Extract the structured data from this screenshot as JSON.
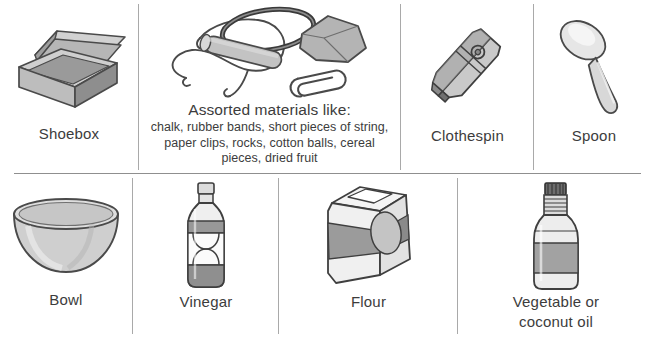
{
  "sheet": {
    "title": "Materials list illustration grid",
    "background": "#ffffff",
    "rule_color": "#a9a9a9",
    "text_color": "#3c3c3c"
  },
  "rows": [
    {
      "name": "top-row",
      "cells": [
        {
          "id": "shoebox",
          "label": "Shoebox",
          "icon": "shoebox-illustration"
        },
        {
          "id": "assorted",
          "label": "",
          "icon": "assorted-materials-illustration",
          "heading": "Assorted materials like:",
          "list": "chalk, rubber bands, short pieces of string, paper clips, rocks, cotton balls, cereal pieces, dried fruit"
        },
        {
          "id": "clothespin",
          "label": "Clothespin",
          "icon": "clothespin-illustration"
        },
        {
          "id": "spoon",
          "label": "Spoon",
          "icon": "spoon-illustration"
        }
      ]
    },
    {
      "name": "bottom-row",
      "cells": [
        {
          "id": "bowl",
          "label": "Bowl",
          "icon": "bowl-illustration"
        },
        {
          "id": "vinegar",
          "label": "Vinegar",
          "icon": "vinegar-bottle-illustration"
        },
        {
          "id": "flour",
          "label": "Flour",
          "icon": "flour-box-illustration"
        },
        {
          "id": "oil",
          "label": "Vegetable or\ncoconut oil",
          "label_line1": "Vegetable or",
          "label_line2": "coconut oil",
          "icon": "oil-bottle-illustration"
        }
      ]
    }
  ],
  "palette": {
    "outline": "#4a4a4a",
    "outline_dark": "#2f2f2f",
    "fill_light": "#f2f2f2",
    "fill_mid": "#cfcfcf",
    "fill_dark": "#9b9b9b",
    "fill_darker": "#7e7e7e"
  }
}
